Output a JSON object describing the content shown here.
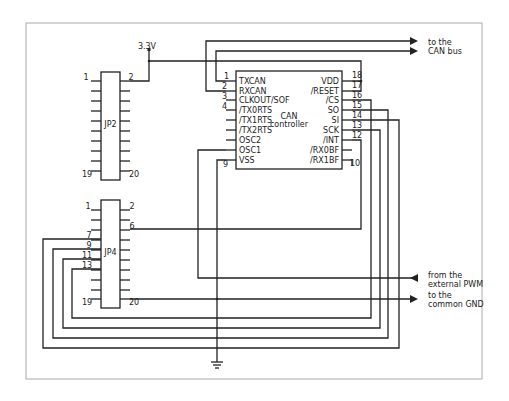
{
  "diagram": {
    "type": "circuit-schematic",
    "supply_label": "3.3V",
    "ground_symbol": "ground",
    "chip": {
      "name_line1": "CAN",
      "name_line2": "controller",
      "left_pins": [
        {
          "num": "1",
          "name": "TXCAN"
        },
        {
          "num": "2",
          "name": "RXCAN"
        },
        {
          "num": "3",
          "name": "CLKOUT/SOF"
        },
        {
          "num": "4",
          "name": "/TX0RTS"
        },
        {
          "num": "",
          "name": "/TX1RTS"
        },
        {
          "num": "",
          "name": "/TX2RTS"
        },
        {
          "num": "",
          "name": "OSC2"
        },
        {
          "num": "",
          "name": "OSC1"
        },
        {
          "num": "9",
          "name": "VSS"
        }
      ],
      "right_pins": [
        {
          "num": "18",
          "name": "VDD"
        },
        {
          "num": "17",
          "name": "/RESET"
        },
        {
          "num": "16",
          "name": "/CS"
        },
        {
          "num": "15",
          "name": "SO"
        },
        {
          "num": "14",
          "name": "SI"
        },
        {
          "num": "13",
          "name": "SCK"
        },
        {
          "num": "12",
          "name": "/INT"
        },
        {
          "num": "",
          "name": "/RX0BF"
        },
        {
          "num": "10",
          "name": "/RX1BF"
        }
      ]
    },
    "jp2": {
      "name": "JP2",
      "labels": {
        "p1": "1",
        "p2": "2",
        "p19": "19",
        "p20": "20"
      }
    },
    "jp4": {
      "name": "JP4",
      "labels": {
        "p1": "1",
        "p2": "2",
        "p6": "6",
        "p7": "7",
        "p9": "9",
        "p11": "11",
        "p13": "13",
        "p19": "19",
        "p20": "20"
      }
    },
    "external": {
      "can_bus_line1": "to the",
      "can_bus_line2": "CAN bus",
      "pwm_line1": "from the",
      "pwm_line2": "external PWM",
      "gnd_line1": "to the",
      "gnd_line2": "common GND"
    }
  }
}
